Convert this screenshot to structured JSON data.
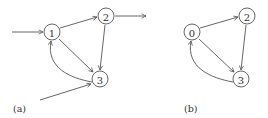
{
  "diagrams": [
    {
      "caption": "(a)",
      "nodes": [
        {
          "id": "1",
          "label": "1"
        },
        {
          "id": "2",
          "label": "2"
        },
        {
          "id": "3",
          "label": "3"
        }
      ],
      "edges": [
        {
          "from": "input",
          "to": "1"
        },
        {
          "from": "1",
          "to": "2"
        },
        {
          "from": "1",
          "to": "3"
        },
        {
          "from": "2",
          "to": "3"
        },
        {
          "from": "3",
          "to": "1"
        },
        {
          "from": "2",
          "to": "output"
        },
        {
          "from": "input",
          "to": "3"
        }
      ]
    },
    {
      "caption": "(b)",
      "nodes": [
        {
          "id": "0",
          "label": "0"
        },
        {
          "id": "2",
          "label": "2"
        },
        {
          "id": "3",
          "label": "3"
        }
      ],
      "edges": [
        {
          "from": "0",
          "to": "2"
        },
        {
          "from": "0",
          "to": "3"
        },
        {
          "from": "2",
          "to": "3"
        },
        {
          "from": "3",
          "to": "0"
        }
      ]
    }
  ]
}
